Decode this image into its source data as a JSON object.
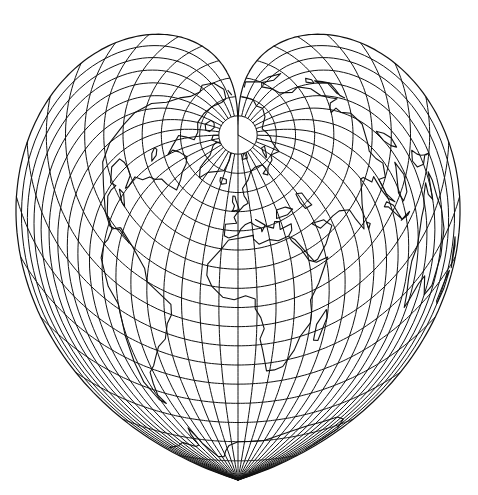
{
  "map": {
    "projection": "Werner (heart-shaped, equal-area cordiform)",
    "width": 478,
    "height": 495,
    "pole_center": [
      238,
      135
    ],
    "south_pole_point": [
      238,
      480
    ],
    "graticule": {
      "parallel_step_deg": 10,
      "meridian_step_deg": 10,
      "polar_cap_colatitude_deg": 10
    },
    "colors": {
      "background": "#ffffff",
      "lines": "#111111"
    },
    "features": [
      "graticule",
      "coastlines",
      "north-polar-cap",
      "heart-outline"
    ],
    "labels": []
  }
}
